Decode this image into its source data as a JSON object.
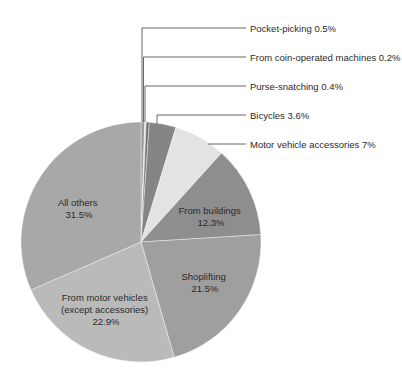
{
  "chart_data": {
    "type": "pie",
    "title": "",
    "start_angle_deg": 0,
    "direction": "clockwise",
    "slices": [
      {
        "label": "Pocket-picking",
        "value": 0.5,
        "display": "Pocket-picking 0.5%",
        "color": "#9a9a9a",
        "label_position": "callout"
      },
      {
        "label": "From coin-operated machines",
        "value": 0.2,
        "display": "From coin-operated machines 0.2%",
        "color": "#d8d8d8",
        "label_position": "callout"
      },
      {
        "label": "Purse-snatching",
        "value": 0.4,
        "display": "Purse-snatching 0.4%",
        "color": "#6e6e6e",
        "label_position": "callout"
      },
      {
        "label": "Bicycles",
        "value": 3.6,
        "display": "Bicycles 3.6%",
        "color": "#858585",
        "label_position": "callout"
      },
      {
        "label": "Motor vehicle accessories",
        "value": 7,
        "display": "Motor vehicle accessories 7%",
        "color": "#e3e3e3",
        "label_position": "callout"
      },
      {
        "label": "From buildings",
        "value": 12.3,
        "display_lines": [
          "From buildings",
          "12.3%"
        ],
        "color": "#8e8e8e",
        "label_position": "inside"
      },
      {
        "label": "Shoplifting",
        "value": 21.5,
        "display_lines": [
          "Shoplifting",
          "21.5%"
        ],
        "color": "#9f9f9f",
        "label_position": "inside"
      },
      {
        "label": "From motor vehicles (except accessories)",
        "value": 22.9,
        "display_lines": [
          "From motor vehicles",
          "(except accessories)",
          "22.9%"
        ],
        "color": "#bababa",
        "label_position": "inside"
      },
      {
        "label": "All others",
        "value": 31.5,
        "display_lines": [
          "All others",
          "31.5%"
        ],
        "color": "#a8a8a8",
        "label_position": "inside"
      }
    ],
    "units": "%",
    "legend": "none (callout labels)"
  }
}
